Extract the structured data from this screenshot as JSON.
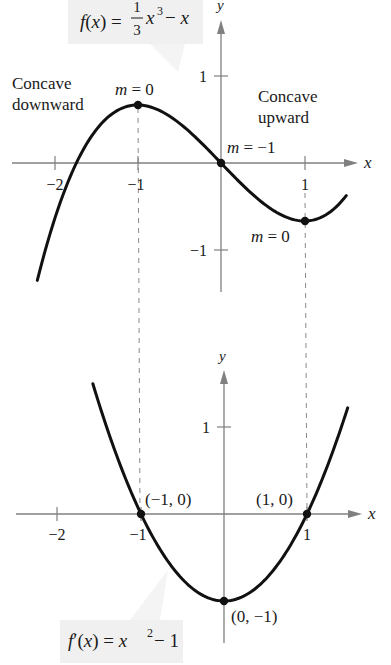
{
  "chart_data": [
    {
      "type": "line",
      "title": "f(x) = (1/3)x^3 - x",
      "function": "f(x) = 1/3 x^3 - x",
      "label": {
        "prefix": "f(x) = ",
        "num": "1",
        "den": "3",
        "var": "x",
        "exp": "3",
        "suffix": " − x"
      },
      "xlabel": "x",
      "ylabel": "y",
      "xlim": [
        -2.2,
        1.5
      ],
      "ylim": [
        -1.6,
        1.6
      ],
      "x_ticks": [
        {
          "value": -2,
          "label": "−2"
        },
        {
          "value": -1,
          "label": "−1"
        },
        {
          "value": 1,
          "label": "1"
        }
      ],
      "y_ticks": [
        {
          "value": 1,
          "label": "1"
        },
        {
          "value": -1,
          "label": "−1"
        }
      ],
      "grid": false,
      "key_points": [
        {
          "x": -1,
          "y": 0.667,
          "annotation": "m = 0"
        },
        {
          "x": 0,
          "y": 0,
          "annotation": "m = −1"
        },
        {
          "x": 1,
          "y": -0.667,
          "annotation": "m = 0"
        }
      ],
      "annotations": [
        {
          "text_line1": "Concave",
          "text_line2": "downward"
        },
        {
          "text_line1": "Concave",
          "text_line2": "upward"
        }
      ]
    },
    {
      "type": "line",
      "title": "f'(x) = x^2 - 1",
      "function": "f'(x) = x^2 - 1",
      "label": {
        "prefix": "f′(x) = x",
        "exp": "2",
        "suffix": " − 1"
      },
      "xlabel": "x",
      "ylabel": "y",
      "xlim": [
        -2.2,
        1.6
      ],
      "ylim": [
        -1.5,
        1.7
      ],
      "x_ticks": [
        {
          "value": -2,
          "label": "−2"
        },
        {
          "value": -1,
          "label": "−1"
        },
        {
          "value": 1,
          "label": "1"
        }
      ],
      "y_ticks": [
        {
          "value": 1,
          "label": "1"
        }
      ],
      "grid": false,
      "key_points": [
        {
          "x": -1,
          "y": 0,
          "annotation": "(−1, 0)"
        },
        {
          "x": 1,
          "y": 0,
          "annotation": "(1, 0)"
        },
        {
          "x": 0,
          "y": -1,
          "annotation": "(0, −1)"
        }
      ]
    }
  ],
  "colors": {
    "curve": "#111111",
    "axis": "#808080",
    "dashed_guide": "#8a8a8a",
    "label_box": "#f0f0f0",
    "text": "#1a1a1a"
  }
}
